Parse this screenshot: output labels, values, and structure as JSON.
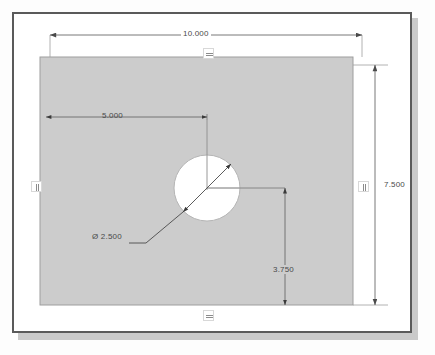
{
  "window": {
    "title": ""
  },
  "sketch": {
    "part_fill_color": "#cccccc",
    "part_edge_color": "#9a9a9a",
    "hole_fill_color": "#ffffff",
    "dimension_color": "#4a4a4a",
    "centerline_color": "#8c8c8c",
    "background_color": "#ffffff"
  },
  "dimensions": [
    {
      "id": "overall-width",
      "label": "10.000",
      "orientation": "horizontal",
      "value": 10.0,
      "position": "top"
    },
    {
      "id": "overall-height",
      "label": "7.500",
      "orientation": "vertical",
      "value": 7.5,
      "position": "right"
    },
    {
      "id": "hole-x-offset",
      "label": "5.000",
      "orientation": "horizontal",
      "value": 5.0,
      "position": "inside-top-left"
    },
    {
      "id": "hole-y-offset",
      "label": "3.750",
      "orientation": "vertical",
      "value": 3.75,
      "position": "inside-bottom-right"
    },
    {
      "id": "hole-diameter",
      "label": "Ø 2.500",
      "orientation": "diameter",
      "value": 2.5,
      "position": "leader-lower-left"
    }
  ],
  "labels": {
    "overall_width": "10.000",
    "overall_height": "7.500",
    "hole_x_offset": "5.000",
    "hole_y_offset": "3.750",
    "hole_diameter": "Ø 2.500"
  },
  "constraints": [
    {
      "id": "top-horizontal",
      "glyph": "horizontal",
      "icon": "horizontal-constraint-icon"
    },
    {
      "id": "bottom-horizontal",
      "glyph": "horizontal",
      "icon": "horizontal-constraint-icon"
    },
    {
      "id": "left-vertical",
      "glyph": "vertical",
      "icon": "vertical-constraint-icon"
    },
    {
      "id": "right-vertical",
      "glyph": "vertical",
      "icon": "vertical-constraint-icon"
    }
  ],
  "geometry": {
    "plate": {
      "x": 40,
      "y": 57,
      "width": 313,
      "height": 248
    },
    "hole": {
      "cx": 207,
      "cy": 188,
      "r": 33
    }
  }
}
